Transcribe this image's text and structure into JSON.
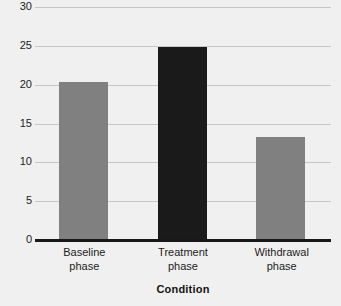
{
  "chart_data": {
    "type": "bar",
    "title": "",
    "xlabel": "Condition",
    "ylabel": "",
    "categories": [
      "Baseline phase",
      "Treatment phase",
      "Withdrawal phase"
    ],
    "category_lines": [
      [
        "Baseline",
        "phase"
      ],
      [
        "Treatment",
        "phase"
      ],
      [
        "Withdrawal",
        "phase"
      ]
    ],
    "values": [
      20.3,
      24.9,
      13.2
    ],
    "bar_colors": [
      "#808080",
      "#1a1a1a",
      "#808080"
    ],
    "ylim": [
      0,
      30
    ],
    "yticks": [
      0,
      5,
      10,
      15,
      20,
      25,
      30
    ],
    "ytick_labels": [
      "0",
      "5",
      "10",
      "15",
      "20",
      "25",
      "30"
    ],
    "grid": true,
    "legend": false,
    "legend_position": "none",
    "background_color": "#f0f0f0",
    "gridline_color": "#c6c6c6",
    "axis_color": "#181818"
  },
  "axis": {
    "x_title": "Condition"
  }
}
